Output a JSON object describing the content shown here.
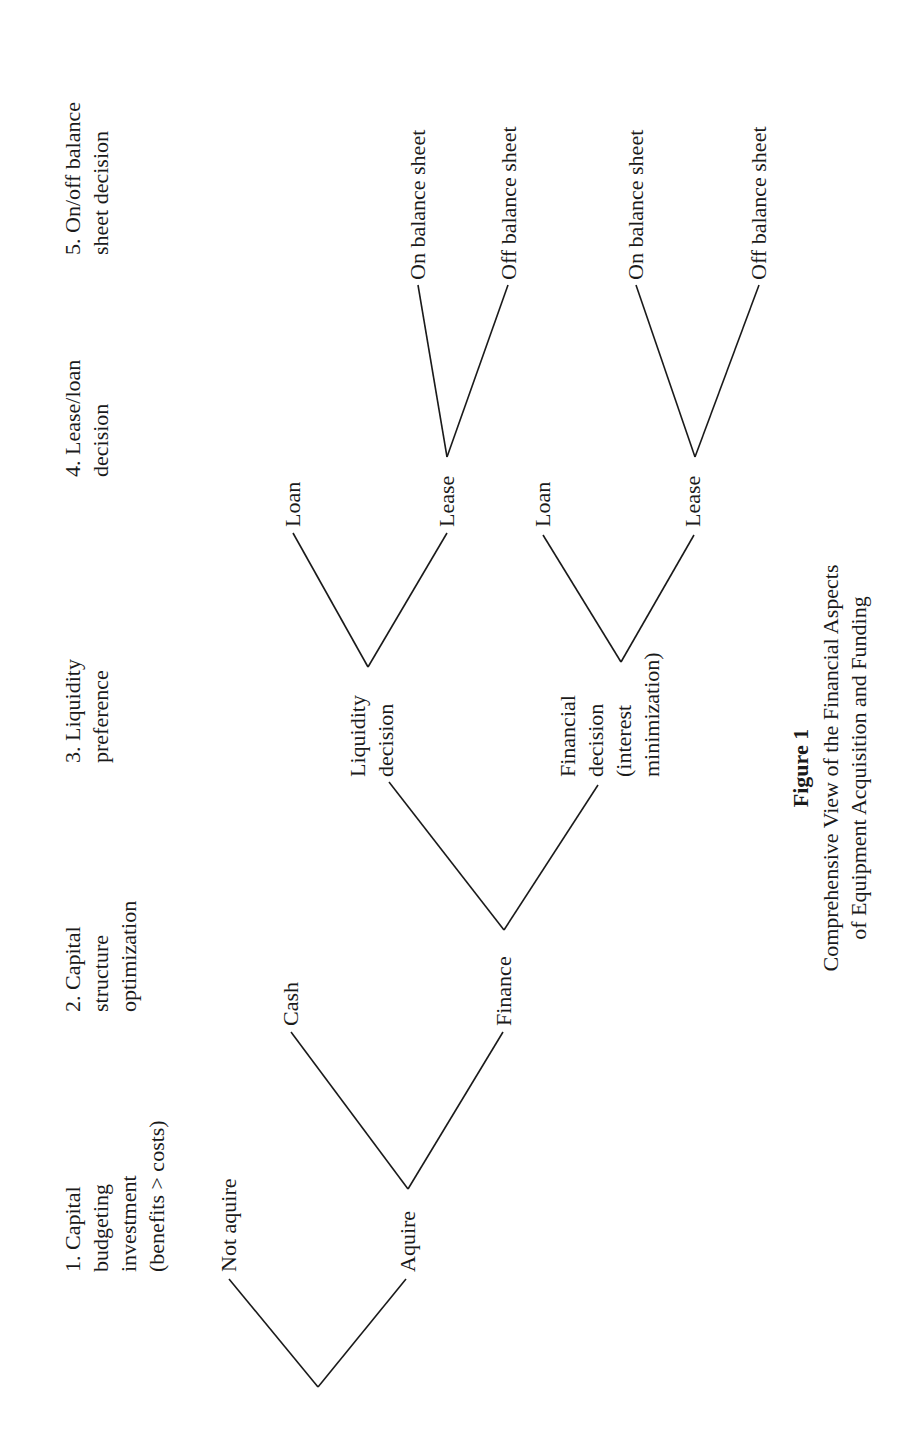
{
  "figure": {
    "orientation": "rotated-90-ccw",
    "headers": [
      {
        "id": "h1",
        "lines": [
          "1. Capital",
          "budgeting",
          "investment",
          "(benefits > costs)"
        ],
        "x": 80,
        "y": 1272
      },
      {
        "id": "h2",
        "lines": [
          "2. Capital",
          "structure",
          "optimization"
        ],
        "x": 80,
        "y": 1012
      },
      {
        "id": "h3",
        "lines": [
          "3. Liquidity",
          "preference"
        ],
        "x": 80,
        "y": 763
      },
      {
        "id": "h4",
        "lines": [
          "4. Lease/loan",
          "decision"
        ],
        "x": 80,
        "y": 477
      },
      {
        "id": "h5",
        "lines": [
          "5. On/off balance",
          "sheet decision"
        ],
        "x": 80,
        "y": 255
      }
    ],
    "nodes": [
      {
        "id": "not-aquire",
        "lines": [
          "Not aquire"
        ],
        "x": 236,
        "y": 1272
      },
      {
        "id": "aquire",
        "lines": [
          "Aquire"
        ],
        "x": 415,
        "y": 1272
      },
      {
        "id": "cash",
        "lines": [
          "Cash"
        ],
        "x": 298,
        "y": 1026
      },
      {
        "id": "finance",
        "lines": [
          "Finance"
        ],
        "x": 511,
        "y": 1026
      },
      {
        "id": "liquidity-decision",
        "lines": [
          "Liquidity",
          "decision"
        ],
        "x": 365,
        "y": 777
      },
      {
        "id": "financial-decision",
        "lines": [
          "Financial",
          "decision",
          "(interest",
          "minimization)"
        ],
        "x": 575,
        "y": 777
      },
      {
        "id": "loan-1",
        "lines": [
          "Loan"
        ],
        "x": 300,
        "y": 527
      },
      {
        "id": "lease-1",
        "lines": [
          "Lease"
        ],
        "x": 454,
        "y": 527
      },
      {
        "id": "loan-2",
        "lines": [
          "Loan"
        ],
        "x": 550,
        "y": 527
      },
      {
        "id": "lease-2",
        "lines": [
          "Lease"
        ],
        "x": 700,
        "y": 527
      },
      {
        "id": "on-balance-1",
        "lines": [
          "On balance sheet"
        ],
        "x": 425,
        "y": 280
      },
      {
        "id": "off-balance-1",
        "lines": [
          "Off balance sheet"
        ],
        "x": 516,
        "y": 280
      },
      {
        "id": "on-balance-2",
        "lines": [
          "On balance sheet"
        ],
        "x": 643,
        "y": 280
      },
      {
        "id": "off-balance-2",
        "lines": [
          "Off balance sheet"
        ],
        "x": 766,
        "y": 280
      }
    ],
    "edges": [
      {
        "from": "root",
        "to": "not-aquire",
        "x1": 318,
        "y1": 1387,
        "x2": 229,
        "y2": 1279
      },
      {
        "from": "root",
        "to": "aquire",
        "x1": 318,
        "y1": 1387,
        "x2": 406,
        "y2": 1279
      },
      {
        "from": "aquire",
        "to": "cash",
        "x1": 408,
        "y1": 1189,
        "x2": 291,
        "y2": 1032
      },
      {
        "from": "aquire",
        "to": "finance",
        "x1": 408,
        "y1": 1189,
        "x2": 503,
        "y2": 1032
      },
      {
        "from": "finance",
        "to": "liquidity-decision",
        "x1": 504,
        "y1": 930,
        "x2": 389,
        "y2": 782
      },
      {
        "from": "finance",
        "to": "financial-decision",
        "x1": 504,
        "y1": 930,
        "x2": 598,
        "y2": 785
      },
      {
        "from": "liquidity-decision",
        "to": "loan-1",
        "x1": 368,
        "y1": 667,
        "x2": 293,
        "y2": 533
      },
      {
        "from": "liquidity-decision",
        "to": "lease-1",
        "x1": 368,
        "y1": 667,
        "x2": 447,
        "y2": 533
      },
      {
        "from": "financial-decision",
        "to": "loan-2",
        "x1": 621,
        "y1": 662,
        "x2": 543,
        "y2": 535
      },
      {
        "from": "financial-decision",
        "to": "lease-2",
        "x1": 621,
        "y1": 662,
        "x2": 694,
        "y2": 535
      },
      {
        "from": "lease-1",
        "to": "on-balance-1",
        "x1": 447,
        "y1": 457,
        "x2": 418,
        "y2": 285
      },
      {
        "from": "lease-1",
        "to": "off-balance-1",
        "x1": 447,
        "y1": 457,
        "x2": 508,
        "y2": 285
      },
      {
        "from": "lease-2",
        "to": "on-balance-2",
        "x1": 695,
        "y1": 457,
        "x2": 636,
        "y2": 285
      },
      {
        "from": "lease-2",
        "to": "off-balance-2",
        "x1": 695,
        "y1": 457,
        "x2": 759,
        "y2": 285
      }
    ],
    "caption": {
      "title": "Figure 1",
      "lines": [
        "Comprehensive View of the Financial Aspects",
        "of Equipment Acquisition and Funding"
      ],
      "center_y": 768,
      "title_x": 808,
      "line_xs": [
        838,
        866
      ]
    },
    "colors": {
      "ink": "#1a1a1a",
      "background": "#ffffff"
    }
  }
}
